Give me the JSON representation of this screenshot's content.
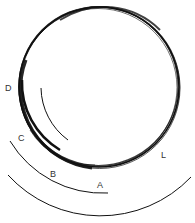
{
  "diagram": {
    "labels": {
      "D": "D",
      "C": "C",
      "B": "B",
      "A": "A",
      "L": "L"
    },
    "colors": {
      "stroke": "#111111",
      "label": "#333333",
      "background": "#ffffff"
    }
  }
}
